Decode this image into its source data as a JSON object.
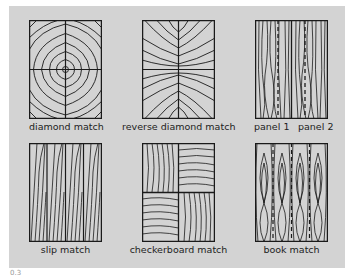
{
  "figure": {
    "background": "#d3d3d3",
    "line_color": "#1a1a1a",
    "caption": "0.3",
    "panels": [
      {
        "id": "diamond",
        "label": "diamond match"
      },
      {
        "id": "reverse-diamond",
        "label": "reverse diamond match"
      },
      {
        "id": "panels",
        "label_left": "panel 1",
        "label_right": "panel 2"
      },
      {
        "id": "slip",
        "label": "slip match"
      },
      {
        "id": "checkerboard",
        "label": "checkerboard match"
      },
      {
        "id": "book",
        "label": "book match"
      }
    ]
  }
}
